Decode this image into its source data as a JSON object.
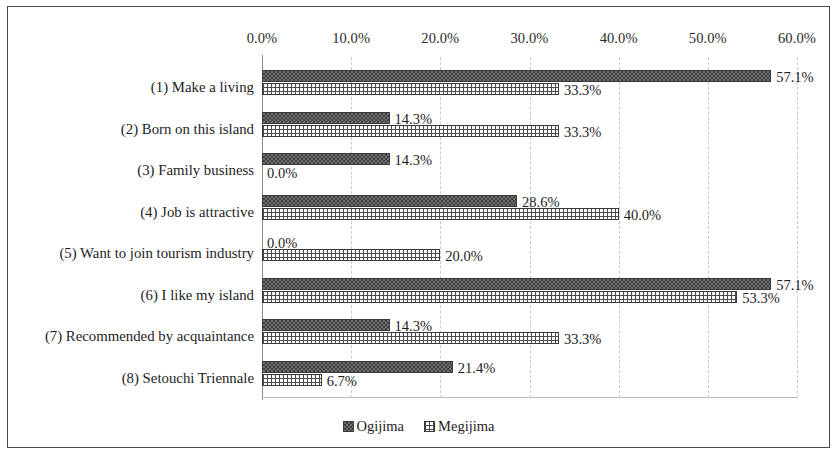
{
  "chart_data": {
    "type": "bar",
    "orientation": "horizontal",
    "title": "",
    "xlabel": "",
    "ylabel": "",
    "xlim": [
      0,
      60
    ],
    "xticks": [
      "0.0%",
      "10.0%",
      "20.0%",
      "30.0%",
      "40.0%",
      "50.0%",
      "60.0%"
    ],
    "xtick_values": [
      0,
      10,
      20,
      30,
      40,
      50,
      60
    ],
    "grid": true,
    "grid_axis": "x",
    "grid_style": "dashed",
    "axis_position": "top",
    "legend_position": "bottom",
    "categories": [
      "(1) Make a living",
      "(2) Born on this island",
      "(3) Family business",
      "(4)  Job is attractive",
      "(5) Want to join tourism industry",
      "(6) I like my island",
      "(7) Recommended by acquaintance",
      "(8) Setouchi Triennale"
    ],
    "series": [
      {
        "name": "Ogijima",
        "pattern": "dark-checker",
        "color": "#6f6f6f",
        "values": [
          57.1,
          14.3,
          14.3,
          28.6,
          0.0,
          57.1,
          14.3,
          21.4
        ],
        "labels": [
          "57.1%",
          "14.3%",
          "14.3%",
          "28.6%",
          "0.0%",
          "57.1%",
          "14.3%",
          "21.4%"
        ]
      },
      {
        "name": "Megijima",
        "pattern": "light-grid",
        "color": "#ffffff",
        "values": [
          33.3,
          33.3,
          0.0,
          40.0,
          20.0,
          53.3,
          33.3,
          6.7
        ],
        "labels": [
          "33.3%",
          "33.3%",
          "0.0%",
          "40.0%",
          "20.0%",
          "53.3%",
          "33.3%",
          "6.7%"
        ]
      }
    ]
  },
  "legend": {
    "items": [
      {
        "label": "Ogijima"
      },
      {
        "label": "Megijima"
      }
    ]
  }
}
